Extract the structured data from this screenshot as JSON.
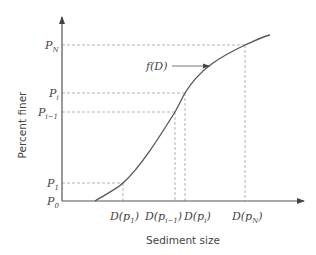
{
  "diagram": {
    "type": "cumulative grain-size distribution curve",
    "xlabel": "Sediment size",
    "ylabel": "Percent finer",
    "curve_label": "f(D)",
    "y_ticks": [
      {
        "main": "P",
        "sub": "N"
      },
      {
        "main": "P",
        "sub": "i"
      },
      {
        "main": "P",
        "sub": "i−1"
      },
      {
        "main": "P",
        "sub": "1"
      },
      {
        "main": "P",
        "sub": "0"
      }
    ],
    "x_ticks": [
      {
        "pre": "D(p",
        "sub": "1",
        "post": ")"
      },
      {
        "pre": "D(p",
        "sub": "i−1",
        "post": ")"
      },
      {
        "pre": "D(p",
        "sub": "i",
        "post": ")"
      },
      {
        "pre": "D(p",
        "sub": "N",
        "post": ")"
      }
    ],
    "colors": {
      "axis": "#555555",
      "curve": "#555555",
      "dash": "#aaaaaa",
      "text": "#444444"
    }
  }
}
